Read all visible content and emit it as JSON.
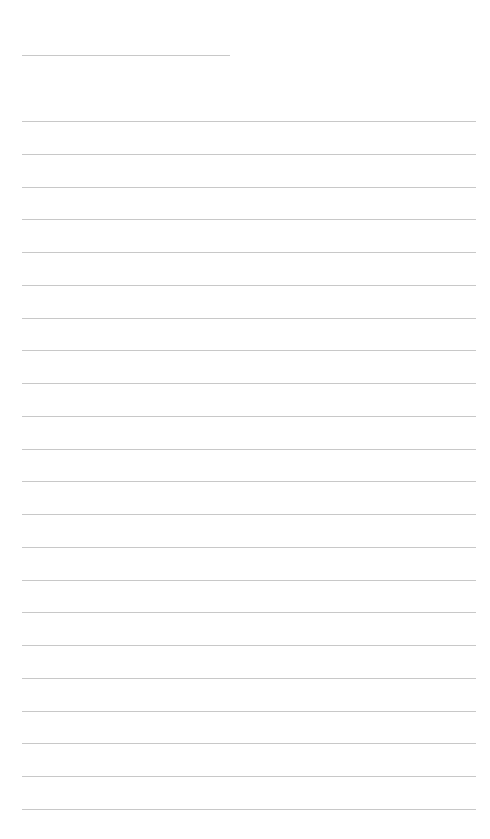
{
  "page": {
    "type": "lined-paper",
    "background_color": "#ffffff",
    "line_color": "#c8c8c8",
    "title_line": {
      "x": 22,
      "y": 55,
      "width": 208
    },
    "writing_lines": {
      "count": 22,
      "x": 22,
      "width": 454,
      "first_y": 121,
      "spacing": 32.76
    }
  }
}
